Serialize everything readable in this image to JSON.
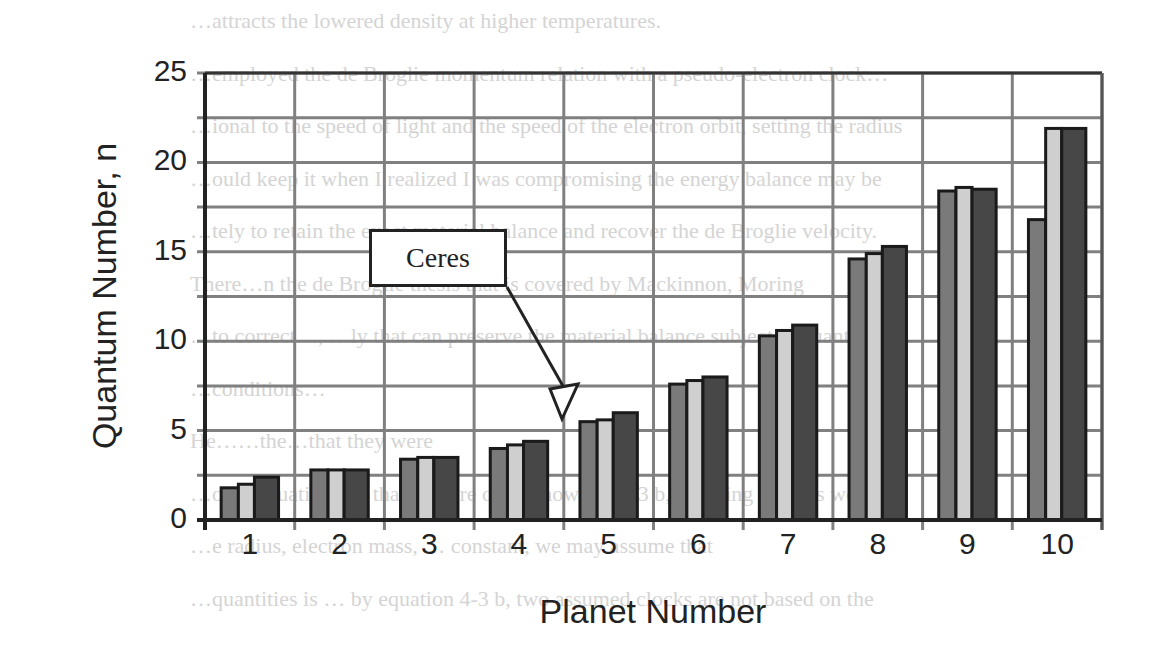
{
  "chart_data": {
    "type": "bar",
    "title": "",
    "xlabel": "Planet Number",
    "ylabel": "Quantum Number, n",
    "ylim": [
      0,
      25
    ],
    "yticks": [
      0,
      5,
      10,
      15,
      20,
      25
    ],
    "grid": true,
    "grid_step": 2.5,
    "legend": null,
    "categories": [
      "1",
      "2",
      "3",
      "4",
      "5",
      "6",
      "7",
      "8",
      "9",
      "10"
    ],
    "series": [
      {
        "name": "Series 1",
        "color": "#7a7a7a",
        "values": [
          1.8,
          2.8,
          3.4,
          4.0,
          5.5,
          7.6,
          10.3,
          14.6,
          18.4,
          16.8
        ]
      },
      {
        "name": "Series 2",
        "color": "#cfcfcf",
        "values": [
          2.0,
          2.8,
          3.5,
          4.2,
          5.6,
          7.8,
          10.6,
          14.9,
          18.6,
          21.9
        ]
      },
      {
        "name": "Series 3",
        "color": "#474747",
        "values": [
          2.4,
          2.8,
          3.5,
          4.4,
          6.0,
          8.0,
          10.9,
          15.3,
          18.5,
          21.9
        ]
      }
    ],
    "annotations": [
      {
        "text": "Ceres",
        "points_to_category": "5",
        "type": "callout-arrow"
      }
    ]
  },
  "labels": {
    "xlabel": "Planet Number",
    "ylabel": "Quantum Number, n",
    "callout": "Ceres",
    "yticks": [
      "0",
      "5",
      "10",
      "15",
      "20",
      "25"
    ],
    "xticks": [
      "1",
      "2",
      "3",
      "4",
      "5",
      "6",
      "7",
      "8",
      "9",
      "10"
    ]
  },
  "background_text": [
    "…attracts the lowered density at higher temperatures.",
    "…employed the de Broglie momentum relation with a pseudo-electron clock…",
    "…ional to the speed of light and the speed of the electron orbit, setting the radius",
    "…ould keep it when I realized I was compromising the energy balance may be",
    "…tely to retain the exact material balance and recover the de Broglie velocity.",
    "There…n the de Broglie thesis that is covered by Mackinnon, Moring",
    "…to correct…, …ly that can preserve the material balance subject to quantum",
    "…conditions…",
    "He……the…that they were",
    "…over equation 4-3 that is more often shown as 4-3 b, knowing now, as we do",
    "…e radius, electron mass, … constant, we may assume that",
    "…quantities is … by equation 4-3 b, two assumed clocks are not based on the"
  ]
}
